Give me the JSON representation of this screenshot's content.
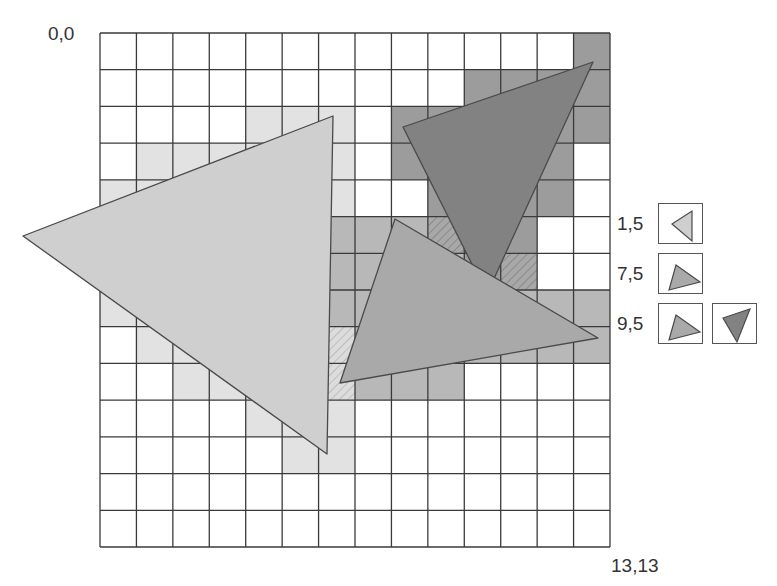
{
  "labels": {
    "origin": "0,0",
    "corner": "13,13"
  },
  "grid": {
    "cols": 14,
    "rows": 14,
    "x0": 100,
    "y0": 33,
    "x1": 610,
    "y1": 547,
    "line_color": "#3a3a3a",
    "cell_colors": {
      "L": "#e2e2e2",
      "M": "#b8b8b8",
      "D": "#9c9c9c",
      "HL": "#dcdcdc",
      "HD": "#a4a4a4"
    },
    "cells": [
      ".............D",
      "..........DDDD",
      "....LLL.DDDDDD",
      ".LLLLLL.DDDDD.",
      "LLLLLLL..DDDD.",
      "LLLLLLMMMHDD..",
      "LLLLLLMMMMDH..",
      "LLLLLLMMMMMMMM",
      ".LLLLLHMMMMMMM",
      "..LLLLHMMM....",
      "....LLL.......",
      ".....LL.......",
      "..............",
      ".............."
    ]
  },
  "shapes": [
    {
      "name": "light-triangle",
      "fill": "#cfcfcf",
      "points": "23,236 333,116 327,454"
    },
    {
      "name": "dark-triangle",
      "fill": "#828282",
      "points": "403,127 593,62 487,294"
    },
    {
      "name": "medium-triangle",
      "fill": "#a9a9a9",
      "points": "395,219 598,338 340,383"
    }
  ],
  "legend": [
    {
      "label": "1,5",
      "icons": [
        {
          "name": "light-triangle-icon",
          "fill": "#cfcfcf",
          "points": "13,20 33,7 33,37"
        }
      ]
    },
    {
      "label": "7,5",
      "icons": [
        {
          "name": "medium-triangle-icon",
          "fill": "#a9a9a9",
          "points": "10,36 17,11 41,28"
        }
      ]
    },
    {
      "label": "9,5",
      "icons": [
        {
          "name": "medium-triangle-icon",
          "fill": "#a9a9a9",
          "points": "10,36 17,11 41,28"
        },
        {
          "name": "dark-triangle-icon",
          "fill": "#828282",
          "points": "10,14 37,5 24,38"
        }
      ]
    }
  ]
}
